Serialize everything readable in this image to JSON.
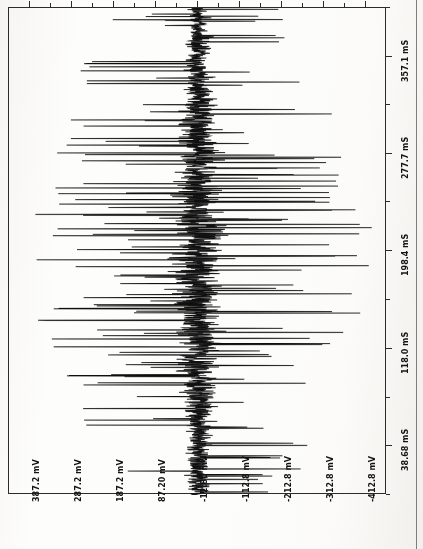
{
  "document": {
    "kind": "oscilloscope-waveform-plot",
    "orientation": "rotated-90-ccw",
    "title": ""
  },
  "chart_data": {
    "type": "line",
    "title": "",
    "subtitle": "",
    "xlabel": "",
    "ylabel": "",
    "grid": false,
    "legend": null,
    "x_unit": "mS",
    "y_unit": "mV",
    "x_tick_labels": [
      "38.68 mS",
      "118.0 mS",
      "198.4 mS",
      "277.7 mS",
      "357.1 mS"
    ],
    "x_ticks": [
      38.68,
      118.0,
      198.4,
      277.7,
      357.1
    ],
    "y_tick_labels": [
      "387.2 mV",
      "287.2 mV",
      "187.2 mV",
      "87.20 mV",
      "-12.80 mV",
      "-112.8 mV",
      "-212.8 mV",
      "-312.8 mV",
      "-412.8 mV"
    ],
    "y_ticks": [
      387.2,
      287.2,
      187.2,
      87.2,
      -12.8,
      -112.8,
      -212.8,
      -312.8,
      -412.8
    ],
    "xlim": [
      -1.0,
      396.8
    ],
    "ylim": [
      -462.8,
      437.2
    ],
    "baseline": -12.8,
    "minor_ticks_per_interval": 1,
    "series": [
      {
        "name": "signal",
        "color": "#101010",
        "description": "dense high-frequency noise burst with large bipolar spikes",
        "envelope_center": -12.8,
        "envelope_peak_mv": 430,
        "sample_count": 2048,
        "seed": 20240517,
        "noise_amplitude_mv": 95,
        "spike_probability": 0.085,
        "spike_amplitude_mv": 420,
        "burst_center_ms": 198.0,
        "burst_width_ms": 230.0
      }
    ]
  },
  "axes": {
    "left_spine": true,
    "top_spine": true,
    "right_spine": false,
    "bottom_spine": false,
    "tick_side": "outer"
  },
  "colors": {
    "ink": "#2b2b2b",
    "trace": "#101010",
    "paper": "#fdfdfc",
    "rule": "#7e7e7e"
  }
}
